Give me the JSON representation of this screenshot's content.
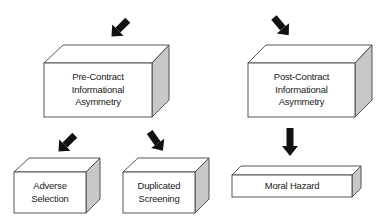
{
  "diagram": {
    "title": "Informational Asymmetry",
    "colors": {
      "face": "#ffffff",
      "side": "#c8c8c8",
      "stroke": "#444444",
      "arrow": "#111111"
    },
    "nodes": {
      "pre": {
        "line1": "Pre-Contract",
        "line2": "Informational",
        "line3": "Asymmetry"
      },
      "post": {
        "line1": "Post-Contract",
        "line2": "Informational",
        "line3": "Asymmetry"
      },
      "adverse": {
        "line1": "Adverse",
        "line2": "Selection"
      },
      "duplicated": {
        "line1": "Duplicated",
        "line2": "Screening"
      },
      "moral": {
        "line1": "Moral Hazard"
      }
    },
    "edges": [
      {
        "from": "(entry)",
        "to": "Pre-Contract Informational Asymmetry"
      },
      {
        "from": "(entry)",
        "to": "Post-Contract Informational Asymmetry"
      },
      {
        "from": "Pre-Contract Informational Asymmetry",
        "to": "Adverse Selection"
      },
      {
        "from": "Pre-Contract Informational Asymmetry",
        "to": "Duplicated Screening"
      },
      {
        "from": "Post-Contract Informational Asymmetry",
        "to": "Moral Hazard"
      }
    ]
  }
}
